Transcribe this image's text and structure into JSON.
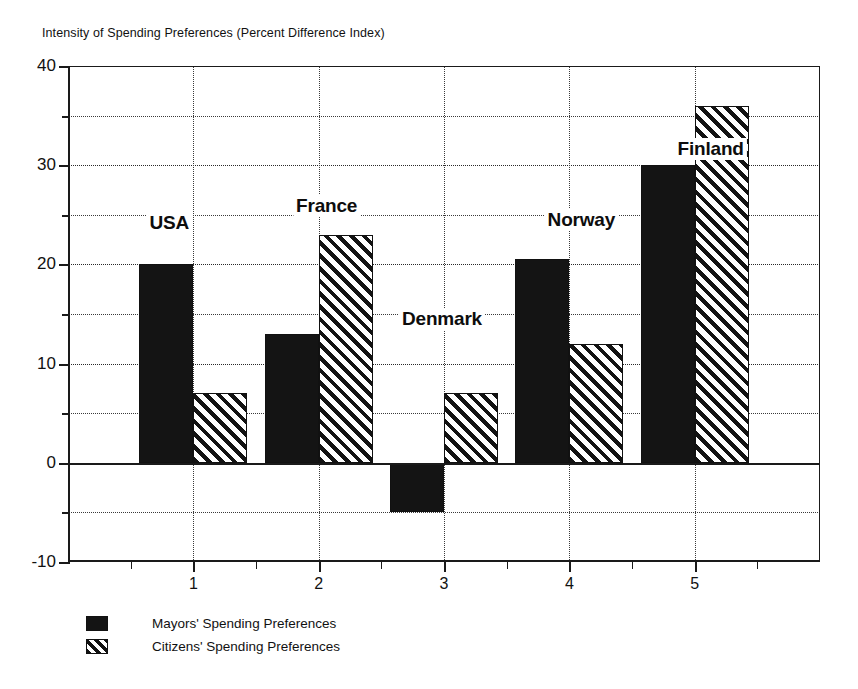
{
  "chart_data": {
    "type": "bar",
    "title": "Intensity of Spending Preferences (Percent Difference Index)",
    "xlabel": "",
    "ylabel": "",
    "categories": [
      "1",
      "2",
      "3",
      "4",
      "5"
    ],
    "xtick_labels": [
      "1",
      "2",
      "3",
      "4",
      "5"
    ],
    "ylim": [
      -10,
      40
    ],
    "ytick_labels": [
      "40",
      "30",
      "20",
      "10",
      "0",
      "-10"
    ],
    "ytick_values": [
      40,
      30,
      20,
      10,
      0,
      -10
    ],
    "yminor_values": [
      35,
      25,
      15,
      5,
      -5
    ],
    "grid": true,
    "legend_position": "below-left",
    "series": [
      {
        "name": "Mayors' Spending Preferences",
        "pattern": "solid-black",
        "values": [
          20,
          13,
          -5,
          20.5,
          30
        ]
      },
      {
        "name": "Citizens' Spending Preferences",
        "pattern": "diagonal-hatch",
        "values": [
          7,
          23,
          7,
          12,
          36
        ]
      }
    ],
    "annotations": [
      {
        "text": "USA",
        "category": "1",
        "x": 1,
        "y": 24.2
      },
      {
        "text": "France",
        "category": "2",
        "x": 2,
        "y": 25.9
      },
      {
        "text": "Denmark",
        "category": "3",
        "x": 3,
        "y": 14.5
      },
      {
        "text": "Norway",
        "category": "4",
        "x": 4,
        "y": 24.5
      },
      {
        "text": "Finland",
        "category": "5",
        "x": 5,
        "y": 31.6
      }
    ]
  },
  "legend": {
    "items": [
      {
        "label": "Mayors' Spending Preferences"
      },
      {
        "label": "Citizens' Spending Preferences"
      }
    ]
  }
}
